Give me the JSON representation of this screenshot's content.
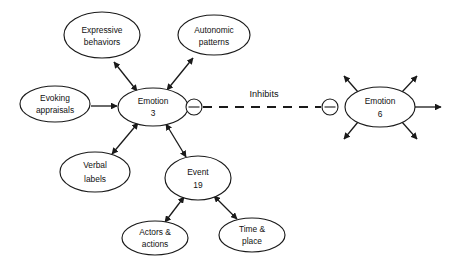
{
  "diagram": {
    "background_color": "#ffffff",
    "stroke_color": "#1a1a1a",
    "nodes": [
      {
        "id": "expressive-behaviors",
        "line1": "Expressive",
        "line2": "behaviors",
        "cx": 102,
        "cy": 35,
        "rx": 38,
        "ry": 23
      },
      {
        "id": "autonomic-patterns",
        "line1": "Autonomic",
        "line2": "patterns",
        "cx": 214,
        "cy": 35,
        "rx": 36,
        "ry": 20
      },
      {
        "id": "evoking-appraisals",
        "line1": "Evoking",
        "line2": "appraisals",
        "cx": 55,
        "cy": 104,
        "rx": 35,
        "ry": 18
      },
      {
        "id": "emotion-3",
        "line1": "Emotion",
        "line2": "3",
        "cx": 153,
        "cy": 107,
        "rx": 35,
        "ry": 19
      },
      {
        "id": "emotion-6",
        "line1": "Emotion",
        "line2": "6",
        "cx": 380,
        "cy": 107,
        "rx": 35,
        "ry": 20
      },
      {
        "id": "verbal-labels",
        "line1": "Verbal",
        "line2": "labels",
        "cx": 95,
        "cy": 172,
        "rx": 35,
        "ry": 20
      },
      {
        "id": "event-19",
        "line1": "Event",
        "line2": "19",
        "cx": 198,
        "cy": 178,
        "rx": 33,
        "ry": 22
      },
      {
        "id": "actors-actions",
        "line1": "Actors &",
        "line2": "actions",
        "cx": 155,
        "cy": 238,
        "rx": 33,
        "ry": 17
      },
      {
        "id": "time-place",
        "line1": "Time &",
        "line2": "place",
        "cx": 252,
        "cy": 235,
        "rx": 33,
        "ry": 17
      }
    ],
    "sign_markers": [
      {
        "id": "inhibit-sign-left",
        "symbol": "minus",
        "cx": 194,
        "cy": 107,
        "r": 8
      },
      {
        "id": "inhibit-sign-right",
        "symbol": "minus",
        "cx": 330,
        "cy": 107,
        "r": 8
      }
    ],
    "edge_labels": [
      {
        "id": "inhibits-label",
        "text": "Inhibits",
        "x": 264,
        "y": 95
      }
    ],
    "edges": [
      {
        "id": "emotion3-expressive",
        "type": "double-arrow",
        "from": "emotion-3",
        "to": "expressive-behaviors"
      },
      {
        "id": "emotion3-autonomic",
        "type": "double-arrow",
        "from": "emotion-3",
        "to": "autonomic-patterns"
      },
      {
        "id": "emotion3-verbal",
        "type": "double-arrow",
        "from": "emotion-3",
        "to": "verbal-labels"
      },
      {
        "id": "emotion3-event19",
        "type": "double-arrow",
        "from": "emotion-3",
        "to": "event-19"
      },
      {
        "id": "event19-actors",
        "type": "double-arrow",
        "from": "event-19",
        "to": "actors-actions"
      },
      {
        "id": "event19-time",
        "type": "double-arrow",
        "from": "event-19",
        "to": "time-place"
      },
      {
        "id": "evoking-emotion3",
        "type": "single-arrow",
        "from": "evoking-appraisals",
        "to": "emotion-3"
      },
      {
        "id": "emotion3-emotion6-inhibits",
        "type": "dashed",
        "from": "emotion-3",
        "to": "emotion-6",
        "label": "Inhibits"
      },
      {
        "id": "emotion6-out-upleft",
        "type": "single-arrow-out",
        "from": "emotion-6"
      },
      {
        "id": "emotion6-out-upright",
        "type": "single-arrow-out",
        "from": "emotion-6"
      },
      {
        "id": "emotion6-out-right",
        "type": "single-arrow-out",
        "from": "emotion-6"
      },
      {
        "id": "emotion6-out-downleft",
        "type": "single-arrow-out",
        "from": "emotion-6"
      },
      {
        "id": "emotion6-out-downright",
        "type": "single-arrow-out",
        "from": "emotion-6"
      }
    ]
  }
}
